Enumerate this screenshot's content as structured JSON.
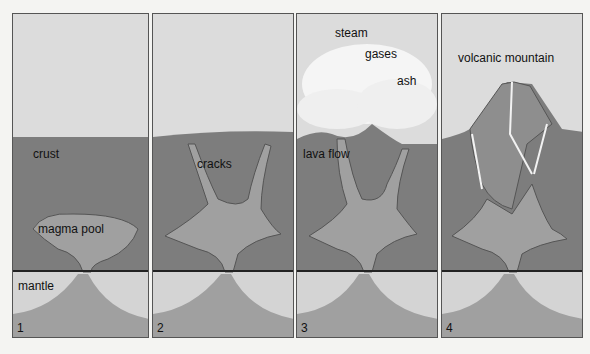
{
  "colors": {
    "sky": "#dcdcdc",
    "crust": "#7d7d7d",
    "magma": "#a0a0a0",
    "mantle": "#d4d4d4",
    "cloud": "#f5f5f5",
    "border": "#555555"
  },
  "panels": [
    {
      "number": "1",
      "labels": {
        "a": "crust",
        "b": "magma pool",
        "c": "mantle"
      }
    },
    {
      "number": "2",
      "labels": {
        "a": "cracks"
      }
    },
    {
      "number": "3",
      "labels": {
        "a": "steam",
        "b": "gases",
        "c": "ash",
        "d": "lava flow"
      }
    },
    {
      "number": "4",
      "labels": {
        "a": "volcanic mountain"
      }
    }
  ]
}
